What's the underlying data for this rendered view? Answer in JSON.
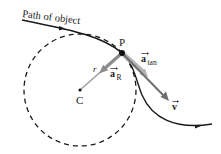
{
  "diagram": {
    "labels": {
      "path": "Path of object",
      "point_p": "P",
      "center_c": "C",
      "radius": "r",
      "a_radial_main": "a",
      "a_radial_sub": "R",
      "a_tan_main": "a",
      "a_tan_sub": "tan",
      "velocity": "v"
    },
    "colors": {
      "path": "#1a1a1a",
      "circle": "#1a1a1a",
      "a_radial": "#8c8c8c",
      "a_tan": "#a6a6a6",
      "velocity": "#6e6e6e",
      "point": "#111111"
    },
    "geometry": {
      "P": [
        122,
        53
      ],
      "C": [
        80,
        90
      ],
      "circle_radius": 56
    }
  }
}
